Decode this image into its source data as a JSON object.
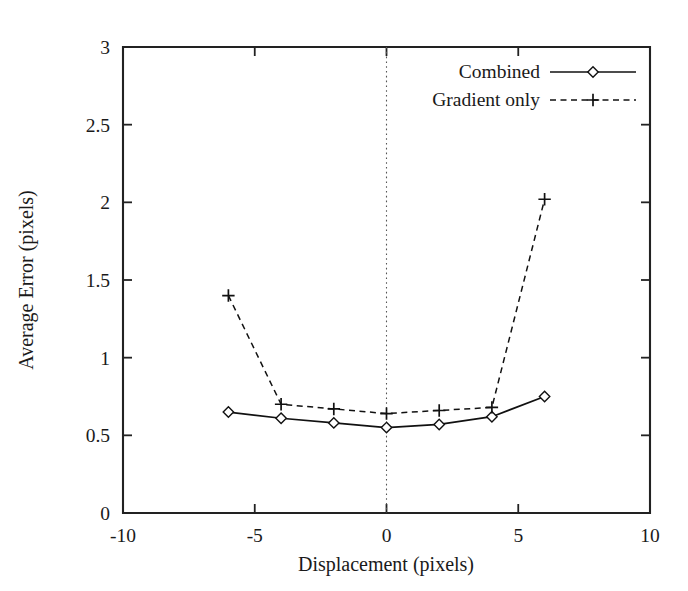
{
  "chart_data": {
    "type": "line",
    "title": "",
    "xlabel": "Displacement (pixels)",
    "ylabel": "Average Error (pixels)",
    "xlim": [
      -10,
      10
    ],
    "ylim": [
      0,
      3
    ],
    "xticks": [
      "-10",
      "-5",
      "0",
      "5",
      "10"
    ],
    "xtick_values": [
      -10,
      -5,
      0,
      5,
      10
    ],
    "yticks": [
      "0",
      "0.5",
      "1",
      "1.5",
      "2",
      "2.5",
      "3"
    ],
    "ytick_values": [
      0,
      0.5,
      1,
      1.5,
      2,
      2.5,
      3
    ],
    "grid": false,
    "zero_reference_line": true,
    "legend_position": "top-right",
    "x": [
      -6,
      -4,
      -2,
      0,
      2,
      4,
      6
    ],
    "series": [
      {
        "name": "Combined",
        "marker": "diamond",
        "linestyle": "solid",
        "values": [
          0.65,
          0.61,
          0.58,
          0.55,
          0.57,
          0.62,
          0.75
        ]
      },
      {
        "name": "Gradient only",
        "marker": "plus",
        "linestyle": "dashed",
        "values": [
          1.4,
          0.7,
          0.67,
          0.64,
          0.66,
          0.68,
          2.02
        ]
      }
    ]
  },
  "legend": {
    "entries": [
      {
        "label": "Combined"
      },
      {
        "label": "Gradient only"
      }
    ]
  },
  "axes": {
    "x_title": "Displacement (pixels)",
    "y_title": "Average Error (pixels)"
  }
}
